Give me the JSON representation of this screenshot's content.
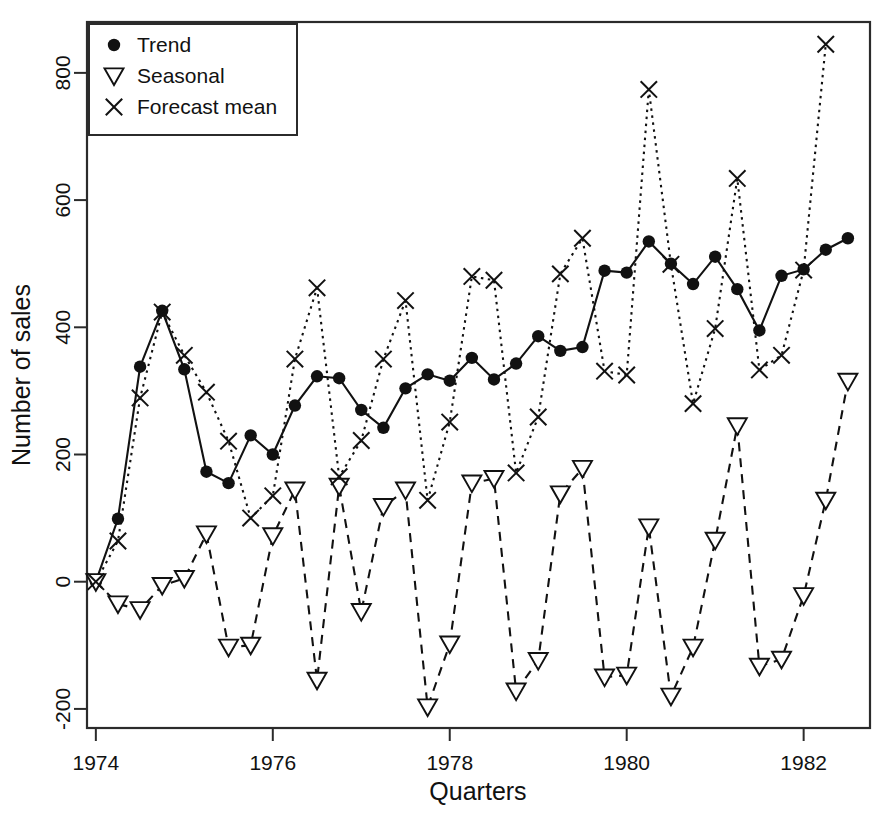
{
  "chart_data": {
    "type": "line",
    "title": "",
    "xlabel": "Quarters",
    "ylabel": "Number of sales",
    "xlim": [
      1973.9,
      1982.75
    ],
    "ylim": [
      -230,
      880
    ],
    "grid": false,
    "legend_position": "top-left",
    "x_ticks": [
      1974,
      1976,
      1978,
      1980,
      1982
    ],
    "x_tick_labels": [
      "1974",
      "1976",
      "1978",
      "1980",
      "1982"
    ],
    "y_ticks": [
      -200,
      0,
      200,
      400,
      600,
      800
    ],
    "y_tick_labels": [
      "-200",
      "0",
      "200",
      "400",
      "600",
      "800"
    ],
    "x": [
      1974.0,
      1974.25,
      1974.5,
      1974.75,
      1975.0,
      1975.25,
      1975.5,
      1975.75,
      1976.0,
      1976.25,
      1976.5,
      1976.75,
      1977.0,
      1977.25,
      1977.5,
      1977.75,
      1978.0,
      1978.25,
      1978.5,
      1978.75,
      1979.0,
      1979.25,
      1979.5,
      1979.75,
      1980.0,
      1980.25,
      1980.5,
      1980.75,
      1981.0,
      1981.25,
      1981.5,
      1981.75,
      1982.0,
      1982.25,
      1982.5
    ],
    "series": [
      {
        "name": "Trend",
        "marker": "filled-circle",
        "linestyle": "solid",
        "values": [
          0,
          99,
          338,
          426,
          334,
          173,
          155,
          230,
          200,
          277,
          323,
          320,
          270,
          242,
          304,
          326,
          316,
          352,
          318,
          343,
          386,
          363,
          369,
          489,
          486,
          535,
          500,
          468,
          511,
          460,
          395,
          481,
          491,
          522,
          540
        ]
      },
      {
        "name": "Seasonal",
        "marker": "open-triangle-down",
        "linestyle": "dashed",
        "values": [
          0,
          -35,
          -44,
          -6,
          5,
          75,
          -103,
          -100,
          72,
          144,
          -155,
          150,
          -47,
          118,
          144,
          -197,
          -98,
          155,
          162,
          -172,
          -124,
          138,
          178,
          -150,
          -147,
          86,
          -180,
          -103,
          65,
          245,
          -133,
          -122,
          -22,
          128,
          315
        ]
      },
      {
        "name": "Forecast mean",
        "marker": "cross",
        "linestyle": "dotted",
        "values": [
          0,
          64,
          289,
          424,
          356,
          298,
          221,
          100,
          135,
          350,
          462,
          165,
          222,
          350,
          442,
          128,
          251,
          480,
          474,
          171,
          259,
          484,
          540,
          331,
          325,
          774,
          499,
          280,
          398,
          634,
          333,
          356,
          490,
          845,
          null
        ]
      }
    ]
  },
  "legend": {
    "entries": [
      {
        "label": "Trend",
        "marker": "filled-circle"
      },
      {
        "label": "Seasonal",
        "marker": "open-triangle-down"
      },
      {
        "label": "Forecast mean",
        "marker": "cross"
      }
    ]
  }
}
